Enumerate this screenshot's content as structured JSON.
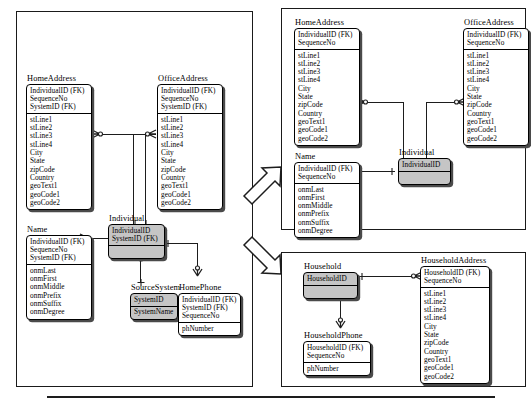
{
  "diagram": {
    "bottom_rule": true,
    "colors": {
      "shaded_entity_fill": "#c5c5c5",
      "entity_fill": "#ffffff",
      "line": "#1d1d1d",
      "shadow": "#4a4a4a",
      "frame_border": "#1a1a1a",
      "background": "#ffffff"
    },
    "arrows": [
      {
        "name": "arrow-to-individual-model",
        "direction": "up-right"
      },
      {
        "name": "arrow-to-household-model",
        "direction": "down-right"
      }
    ]
  },
  "panels": {
    "source": {
      "name": "source-model-panel"
    },
    "individual": {
      "name": "individual-model-panel"
    },
    "household": {
      "name": "household-model-panel"
    }
  },
  "entities": {
    "src_home_address": {
      "name": "HomeAddress",
      "keys": [
        "IndividualID (FK)",
        "SequenceNo",
        "SystemID (FK)"
      ],
      "attributes": [
        "stLine1",
        "stLine2",
        "stLine3",
        "stLine4",
        "City",
        "State",
        "zipCode",
        "Country",
        "geoText1",
        "geoCode1",
        "geoCode2"
      ],
      "shaded": false
    },
    "src_office_address": {
      "name": "OfficeAddress",
      "keys": [
        "IndividualID (FK)",
        "SequenceNo",
        "SystemID (FK)"
      ],
      "attributes": [
        "stLine1",
        "stLine2",
        "stLine3",
        "stLine4",
        "City",
        "State",
        "zipCode",
        "Country",
        "geoText1",
        "geoCode1",
        "geoCode2"
      ],
      "shaded": false
    },
    "src_name": {
      "name": "Name",
      "keys": [
        "IndividualID (FK)",
        "SequenceNo",
        "SystemID (FK)"
      ],
      "attributes": [
        "onmLast",
        "onmFirst",
        "onmMiddle",
        "onmPrefix",
        "onmSuffix",
        "onmDegree"
      ],
      "shaded": false
    },
    "src_individual": {
      "name": "Individual",
      "keys": [
        "IndividualID",
        "SystemID (FK)"
      ],
      "attributes": [
        ""
      ],
      "shaded": true
    },
    "src_source_system": {
      "name": "SourceSystem",
      "keys": [
        "SystemID"
      ],
      "attributes": [
        "SystemName"
      ],
      "shaded": true
    },
    "src_home_phone": {
      "name": "HomePhone",
      "keys": [
        "IndividualID (FK)",
        "SystemID (FK)",
        "SequenceNo"
      ],
      "attributes": [
        "phNumber"
      ],
      "shaded": false
    },
    "ind_home_address": {
      "name": "HomeAddress",
      "keys": [
        "IndividualID (FK)",
        "SequenceNo"
      ],
      "attributes": [
        "stLine1",
        "stLine2",
        "stLine3",
        "stLine4",
        "City",
        "State",
        "zipCode",
        "Country",
        "geoText1",
        "geoCode1",
        "geoCode2"
      ],
      "shaded": false
    },
    "ind_office_address": {
      "name": "OfficeAddress",
      "keys": [
        "IndividualID (FK)",
        "SequenceNo"
      ],
      "attributes": [
        "stLine1",
        "stLine2",
        "stLine3",
        "stLine4",
        "City",
        "State",
        "zipCode",
        "Country",
        "geoText1",
        "geoCode1",
        "geoCode2"
      ],
      "shaded": false
    },
    "ind_name": {
      "name": "Name",
      "keys": [
        "IndividualID (FK)",
        "SequenceNo"
      ],
      "attributes": [
        "onmLast",
        "onmFirst",
        "onmMiddle",
        "onmPrefix",
        "onmSuffix",
        "onmDegree"
      ],
      "shaded": false
    },
    "ind_individual": {
      "name": "Individual",
      "keys": [
        "IndividualID"
      ],
      "attributes": [
        ""
      ],
      "shaded": true
    },
    "hh_household": {
      "name": "Household",
      "keys": [
        "HouseholdID"
      ],
      "attributes": [
        ""
      ],
      "shaded": true
    },
    "hh_household_address": {
      "name": "HouseholdAddress",
      "keys": [
        "HouseholdID (FK)",
        "SequenceNo"
      ],
      "attributes": [
        "stLine1",
        "stLine2",
        "stLine3",
        "stLine4",
        "City",
        "State",
        "zipCode",
        "Country",
        "geoText1",
        "geoCode1",
        "geoCode2"
      ],
      "shaded": false
    },
    "hh_household_phone": {
      "name": "HouseholdPhone",
      "keys": [
        "HouseholdID (FK)",
        "SequenceNo"
      ],
      "attributes": [
        "phNumber"
      ],
      "shaded": false
    }
  }
}
